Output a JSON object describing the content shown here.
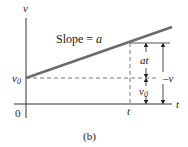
{
  "figure": {
    "caption": "(b)",
    "axes": {
      "y_label": "v",
      "x_label": "t",
      "origin_label": "0"
    },
    "line": {
      "label_prefix": "Slope = ",
      "label_var": "a",
      "color": "#6b6b6b"
    },
    "markers": {
      "v0_label": "v",
      "v0_sub": "0",
      "t_label": "t"
    },
    "dimensions": {
      "at_label": "at",
      "v_label": "v",
      "v0_label": "v",
      "v0_sub": "0"
    }
  }
}
